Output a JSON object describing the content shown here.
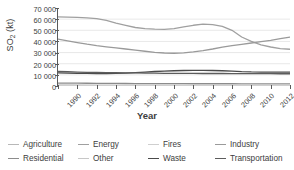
{
  "chart_data": {
    "type": "line",
    "title": "",
    "xlabel": "Year",
    "ylabel": "SO2 (kt)",
    "ylabel_base": "SO",
    "ylabel_sub": "2",
    "ylabel_unit": " (kt)",
    "grid": "horizontal",
    "legend_position": "bottom",
    "xlim": [
      1990,
      2014
    ],
    "ylim": [
      0,
      70000
    ],
    "yticks": [
      70000,
      60000,
      50000,
      40000,
      30000,
      20000,
      10000,
      0
    ],
    "ytick_labels": [
      "70 000",
      "60 000",
      "50 000",
      "40 000",
      "30 000",
      "20 000",
      "10 000",
      "0"
    ],
    "xticks": [
      1990,
      1992,
      1994,
      1996,
      1998,
      2000,
      2002,
      2004,
      2006,
      2008,
      2010,
      2012,
      2014
    ],
    "xtick_labels": [
      "1990",
      "1992",
      "1994",
      "1996",
      "1998",
      "2000",
      "2002",
      "2004",
      "2006",
      "2008",
      "2010",
      "2012",
      "2014"
    ],
    "x": [
      1990,
      1991,
      1992,
      1993,
      1994,
      1995,
      1996,
      1997,
      1998,
      1999,
      2000,
      2001,
      2002,
      2003,
      2004,
      2005,
      2006,
      2007,
      2008,
      2009,
      2010,
      2011,
      2012,
      2013,
      2014
    ],
    "series": [
      {
        "name": "Agriculture",
        "color": "#b8b8b8",
        "values": [
          300,
          300,
          300,
          300,
          300,
          300,
          300,
          300,
          300,
          300,
          300,
          300,
          300,
          300,
          300,
          300,
          300,
          300,
          300,
          300,
          300,
          300,
          300,
          300,
          300
        ]
      },
      {
        "name": "Residential",
        "color": "#8c8c8c",
        "values": [
          2600,
          2550,
          2500,
          2450,
          2400,
          2350,
          2300,
          2250,
          2200,
          2150,
          2100,
          2080,
          2060,
          2050,
          2040,
          2030,
          2020,
          2010,
          2000,
          1990,
          1980,
          1970,
          1960,
          1950,
          1940
        ]
      },
      {
        "name": "Energy",
        "color": "#a0a0a0",
        "values": [
          62000,
          61800,
          61500,
          61200,
          60500,
          58800,
          56500,
          54500,
          52500,
          51500,
          51000,
          50800,
          51500,
          53000,
          54500,
          55500,
          55000,
          53500,
          50000,
          44000,
          40000,
          37000,
          35000,
          33500,
          33000
        ]
      },
      {
        "name": "Other",
        "color": "#c7c7c7",
        "values": [
          900,
          900,
          880,
          870,
          860,
          850,
          840,
          830,
          820,
          810,
          800,
          800,
          800,
          800,
          800,
          800,
          800,
          800,
          790,
          780,
          780,
          770,
          770,
          760,
          760
        ]
      },
      {
        "name": "Fires",
        "color": "#cfcfcf",
        "values": [
          450,
          430,
          420,
          430,
          440,
          460,
          450,
          440,
          470,
          460,
          450,
          440,
          450,
          460,
          455,
          450,
          445,
          440,
          435,
          430,
          430,
          425,
          425,
          420,
          420
        ]
      },
      {
        "name": "Waste",
        "color": "#4a4a4a",
        "values": [
          11800,
          11600,
          11400,
          11300,
          11200,
          11200,
          11300,
          11600,
          12000,
          12500,
          13000,
          13400,
          13700,
          13900,
          14000,
          14000,
          13900,
          13700,
          13400,
          12900,
          12600,
          12500,
          12450,
          12400,
          12400
        ]
      },
      {
        "name": "Industry",
        "color": "#9a9a9a",
        "values": [
          42000,
          40500,
          39000,
          37500,
          36200,
          35200,
          34200,
          33200,
          32200,
          31200,
          30200,
          29600,
          29400,
          29800,
          30600,
          31800,
          33200,
          34800,
          36200,
          37400,
          38600,
          39800,
          41000,
          42500,
          43800
        ]
      },
      {
        "name": "Transportation",
        "color": "#5c5c5c",
        "values": [
          13000,
          12800,
          12500,
          12300,
          12100,
          12000,
          11900,
          11800,
          11700,
          11600,
          11500,
          11400,
          11350,
          11300,
          11250,
          11200,
          11200,
          11200,
          11150,
          11100,
          11100,
          11050,
          11050,
          11000,
          11000
        ]
      }
    ]
  },
  "legend": {
    "rows": [
      [
        {
          "label": "Agriculture",
          "color": "#b8b8b8"
        },
        {
          "label": "Energy",
          "color": "#a0a0a0"
        },
        {
          "label": "Fires",
          "color": "#cfcfcf"
        },
        {
          "label": "Industry",
          "color": "#9a9a9a"
        }
      ],
      [
        {
          "label": "Residential",
          "color": "#8c8c8c"
        },
        {
          "label": "Other",
          "color": "#c7c7c7"
        },
        {
          "label": "Waste",
          "color": "#4a4a4a"
        },
        {
          "label": "Transportation",
          "color": "#5c5c5c"
        }
      ]
    ]
  },
  "style": {
    "grid_color": "#e2e2e2",
    "axis_color": "#5a5a5a",
    "text_color": "#3d3d3d",
    "background": "#ffffff"
  }
}
